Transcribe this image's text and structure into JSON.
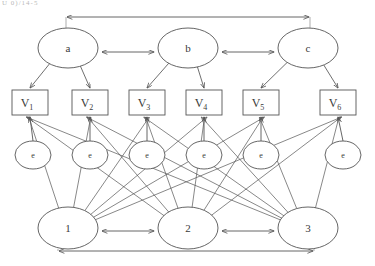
{
  "figure": {
    "type": "path-diagram",
    "title_fragment": "U 0)/14-5",
    "stroke_color": "#555555",
    "text_color": "#3a3a3a",
    "background": "#ffffff"
  },
  "latent_nodes": [
    {
      "id": "a",
      "label": "a",
      "cx": 68,
      "cy": 48,
      "rx": 30,
      "ry": 20
    },
    {
      "id": "b",
      "label": "b",
      "cx": 188,
      "cy": 48,
      "rx": 30,
      "ry": 20
    },
    {
      "id": "c",
      "label": "c",
      "cx": 308,
      "cy": 48,
      "rx": 30,
      "ry": 20
    }
  ],
  "indicator_boxes": [
    {
      "id": "V1",
      "label": "V",
      "sub": "1",
      "x": 12,
      "y": 90,
      "w": 36,
      "h": 25
    },
    {
      "id": "V2",
      "label": "V",
      "sub": "2",
      "x": 72,
      "y": 90,
      "w": 36,
      "h": 25
    },
    {
      "id": "V3",
      "label": "V",
      "sub": "3",
      "x": 129,
      "y": 90,
      "w": 36,
      "h": 25
    },
    {
      "id": "V4",
      "label": "V",
      "sub": "4",
      "x": 186,
      "y": 90,
      "w": 36,
      "h": 25
    },
    {
      "id": "V5",
      "label": "V",
      "sub": "5",
      "x": 243,
      "y": 90,
      "w": 36,
      "h": 25
    },
    {
      "id": "V6",
      "label": "V",
      "sub": "6",
      "x": 320,
      "y": 90,
      "w": 36,
      "h": 25
    }
  ],
  "error_nodes": [
    {
      "id": "e1",
      "label": "e",
      "cx": 33,
      "cy": 155,
      "rx": 18,
      "ry": 14
    },
    {
      "id": "e2",
      "label": "e",
      "cx": 90,
      "cy": 155,
      "rx": 18,
      "ry": 14
    },
    {
      "id": "e3",
      "label": "e",
      "cx": 147,
      "cy": 155,
      "rx": 18,
      "ry": 14
    },
    {
      "id": "e4",
      "label": "e",
      "cx": 204,
      "cy": 155,
      "rx": 18,
      "ry": 14
    },
    {
      "id": "e5",
      "label": "e",
      "cx": 261,
      "cy": 155,
      "rx": 18,
      "ry": 14
    },
    {
      "id": "e6",
      "label": "e",
      "cx": 343,
      "cy": 155,
      "rx": 18,
      "ry": 14
    }
  ],
  "bottom_nodes": [
    {
      "id": "n1",
      "label": "1",
      "cx": 68,
      "cy": 228,
      "rx": 30,
      "ry": 21
    },
    {
      "id": "n2",
      "label": "2",
      "cx": 188,
      "cy": 228,
      "rx": 30,
      "ry": 21
    },
    {
      "id": "n3",
      "label": "3",
      "cx": 308,
      "cy": 228,
      "rx": 30,
      "ry": 21
    }
  ],
  "covariance_arrows": [
    {
      "id": "a-b",
      "from": "a",
      "to": "b",
      "style": "double",
      "y": 52
    },
    {
      "id": "b-c",
      "from": "b",
      "to": "c",
      "style": "double",
      "y": 52
    },
    {
      "id": "a-c",
      "from": "a",
      "to": "c",
      "style": "double",
      "y": 17
    },
    {
      "id": "n1-n2",
      "from": "1",
      "to": "2",
      "style": "double",
      "y": 231
    },
    {
      "id": "n2-n3",
      "from": "2",
      "to": "3",
      "style": "double",
      "y": 231
    },
    {
      "id": "n1-n3",
      "from": "1",
      "to": "3",
      "style": "double",
      "y": 251
    }
  ],
  "loadings": [
    {
      "from": "a",
      "to": "V1"
    },
    {
      "from": "a",
      "to": "V2"
    },
    {
      "from": "b",
      "to": "V3"
    },
    {
      "from": "b",
      "to": "V4"
    },
    {
      "from": "c",
      "to": "V5"
    },
    {
      "from": "c",
      "to": "V6"
    }
  ],
  "error_paths": [
    {
      "from": "e1",
      "to": "V1"
    },
    {
      "from": "e2",
      "to": "V2"
    },
    {
      "from": "e3",
      "to": "V3"
    },
    {
      "from": "e4",
      "to": "V4"
    },
    {
      "from": "e5",
      "to": "V5"
    },
    {
      "from": "e6",
      "to": "V6"
    }
  ],
  "cross_paths": [
    {
      "from": "1",
      "to": "V1"
    },
    {
      "from": "1",
      "to": "V2"
    },
    {
      "from": "1",
      "to": "V3"
    },
    {
      "from": "1",
      "to": "V4"
    },
    {
      "from": "1",
      "to": "V5"
    },
    {
      "from": "1",
      "to": "V6"
    },
    {
      "from": "2",
      "to": "V1"
    },
    {
      "from": "2",
      "to": "V2"
    },
    {
      "from": "2",
      "to": "V3"
    },
    {
      "from": "2",
      "to": "V4"
    },
    {
      "from": "2",
      "to": "V5"
    },
    {
      "from": "2",
      "to": "V6"
    },
    {
      "from": "3",
      "to": "V1"
    },
    {
      "from": "3",
      "to": "V2"
    },
    {
      "from": "3",
      "to": "V3"
    },
    {
      "from": "3",
      "to": "V4"
    },
    {
      "from": "3",
      "to": "V5"
    },
    {
      "from": "3",
      "to": "V6"
    }
  ]
}
